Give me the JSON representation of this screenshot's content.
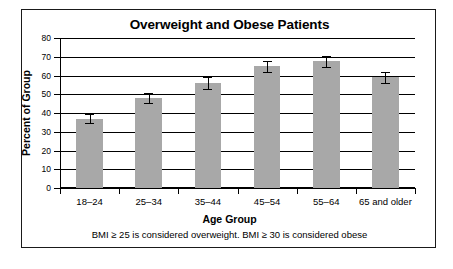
{
  "figure": {
    "title": "Overweight and Obese Patients",
    "footnote": "BMI ≥ 25 is considered overweight. BMI ≥ 30 is considered obese",
    "border_color": "#1a1a1a",
    "background": "#ffffff"
  },
  "chart_data": {
    "type": "bar",
    "title": "Overweight and Obese Patients",
    "xlabel": "Age Group",
    "ylabel": "Percent of Group",
    "categories": [
      "18–24",
      "25–34",
      "35–44",
      "45–54",
      "55–64",
      "65 and older"
    ],
    "values": [
      37,
      48,
      56,
      65,
      67.5,
      59
    ],
    "errors": [
      2.5,
      2.5,
      3,
      3,
      3,
      3
    ],
    "ylim": [
      0,
      80
    ],
    "yticks": [
      0,
      10,
      20,
      30,
      40,
      50,
      60,
      70,
      80
    ],
    "ytick_labels": [
      "0",
      "10",
      "20",
      "30",
      "40",
      "50",
      "60",
      "70",
      "80"
    ],
    "grid": true,
    "legend": false,
    "bar_color": "#a8a8a8",
    "error_bar_color": "#000000",
    "annotations": [
      "BMI ≥ 25 is considered overweight. BMI ≥ 30 is considered obese"
    ]
  }
}
